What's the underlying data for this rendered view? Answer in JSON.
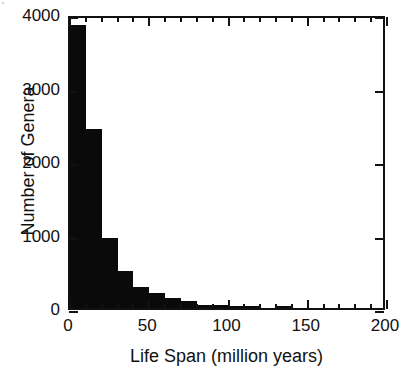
{
  "chart_data": {
    "type": "bar",
    "title": "",
    "subtitle": "",
    "xlabel": "Life Span (million years)",
    "ylabel": "Number of Genera",
    "xlim": [
      0,
      200
    ],
    "ylim": [
      0,
      4000
    ],
    "bin_width": 10,
    "grid": false,
    "legend": null,
    "bar_color": "#0a0a0a",
    "axis_color": "#111111",
    "xticks_major": [
      0,
      50,
      100,
      150,
      200
    ],
    "xtick_labels": [
      "0",
      "50",
      "100",
      "150",
      "200"
    ],
    "xticks_minor": [
      10,
      20,
      30,
      40,
      60,
      70,
      80,
      90,
      110,
      120,
      130,
      140,
      160,
      170,
      180,
      190
    ],
    "yticks_major": [
      0,
      1000,
      2000,
      3000,
      4000
    ],
    "ytick_labels": [
      "0",
      "1000",
      "2000",
      "3000",
      "4000"
    ],
    "categories": [
      "0-10",
      "10-20",
      "20-30",
      "30-40",
      "40-50",
      "50-60",
      "60-70",
      "70-80",
      "80-90",
      "90-100",
      "100-110",
      "110-120",
      "120-130",
      "130-140",
      "140-150",
      "150-160"
    ],
    "bin_starts": [
      0,
      10,
      20,
      30,
      40,
      50,
      60,
      70,
      80,
      90,
      100,
      110,
      120,
      130,
      140,
      150
    ],
    "values": [
      3850,
      2440,
      950,
      500,
      290,
      200,
      130,
      90,
      40,
      35,
      30,
      25,
      0,
      30,
      0,
      0
    ]
  },
  "figure": {
    "corner_mark": "'"
  }
}
